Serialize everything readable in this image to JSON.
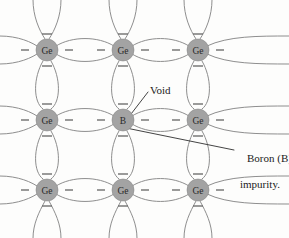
{
  "figure": {
    "kind": "crystal-lattice-diagram",
    "width": 289,
    "height": 238,
    "background_color": "#fdfdfc"
  },
  "style": {
    "bond_color": "#8e8e8e",
    "atom_fill": "#a3a3a3",
    "atom_stroke": "#8a8a8a",
    "atom_text_color": "#2a2a2a",
    "electron_color": "#6f6f6f",
    "leader_color": "#2f2f2f",
    "annotation_color": "#1b1b1b"
  },
  "lattice": {
    "rows": 3,
    "cols": 3,
    "column_x": [
      47,
      123,
      198
    ],
    "row_y": [
      50,
      120,
      190
    ],
    "atom_radius": 11,
    "atoms": [
      {
        "id": "a-0-0",
        "symbol": "Ge",
        "row": 0,
        "col": 0,
        "cx": 47,
        "cy": 50,
        "kind": "host"
      },
      {
        "id": "a-0-1",
        "symbol": "Ge",
        "row": 0,
        "col": 1,
        "cx": 123,
        "cy": 50,
        "kind": "host"
      },
      {
        "id": "a-0-2",
        "symbol": "Ge",
        "row": 0,
        "col": 2,
        "cx": 198,
        "cy": 50,
        "kind": "host"
      },
      {
        "id": "a-1-0",
        "symbol": "Ge",
        "row": 1,
        "col": 0,
        "cx": 47,
        "cy": 120,
        "kind": "host"
      },
      {
        "id": "a-1-1",
        "symbol": "B",
        "row": 1,
        "col": 1,
        "cx": 123,
        "cy": 120,
        "kind": "impurity"
      },
      {
        "id": "a-1-2",
        "symbol": "Ge",
        "row": 1,
        "col": 2,
        "cx": 198,
        "cy": 120,
        "kind": "host"
      },
      {
        "id": "a-2-0",
        "symbol": "Ge",
        "row": 2,
        "col": 0,
        "cx": 47,
        "cy": 190,
        "kind": "host"
      },
      {
        "id": "a-2-1",
        "symbol": "Ge",
        "row": 2,
        "col": 1,
        "cx": 123,
        "cy": 190,
        "kind": "host"
      },
      {
        "id": "a-2-2",
        "symbol": "Ge",
        "row": 2,
        "col": 2,
        "cx": 198,
        "cy": 190,
        "kind": "host"
      }
    ]
  },
  "annotations": {
    "void": {
      "text": "Void",
      "x": 150,
      "y": 84,
      "leader_from": [
        128,
        118
      ],
      "leader_to": [
        148,
        92
      ]
    },
    "impurity": {
      "line1": "Boron (B)",
      "line2": "impurity.",
      "x": 236,
      "y": 139,
      "leader_from": [
        126,
        128
      ],
      "leader_to": [
        234,
        150
      ]
    }
  }
}
